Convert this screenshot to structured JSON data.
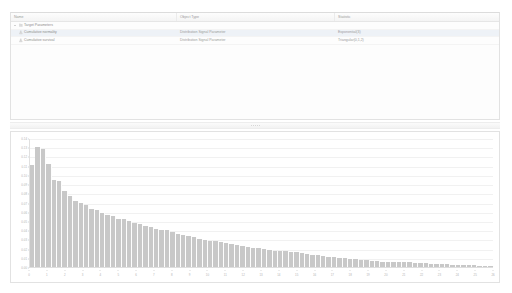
{
  "tree": {
    "columns": [
      {
        "key": "name",
        "label": "Name"
      },
      {
        "key": "type",
        "label": "Object Type"
      },
      {
        "key": "value",
        "label": "Statistic"
      }
    ],
    "rows": [
      {
        "level": 0,
        "expanded": true,
        "icon": "folder-node-icon",
        "name": "Target Parameters",
        "type": "",
        "value": "",
        "selected": false
      },
      {
        "level": 1,
        "icon": "signal-leaf-icon",
        "name": "Cumulative normality",
        "type": "Distribution Signal Parameter",
        "value": "Exponential(3)",
        "selected": true
      },
      {
        "level": 1,
        "icon": "signal-leaf-icon",
        "name": "Cumulative survival",
        "type": "Distribution Signal Parameter",
        "value": "Triangular(0,1,2)",
        "selected": false
      }
    ]
  },
  "splitter": {
    "name": "horizontal-splitter",
    "grip_dots": 5
  },
  "chart_data": {
    "type": "bar",
    "title": "",
    "subtitle": "",
    "xlabel": "",
    "ylabel": "",
    "grid": true,
    "legend": false,
    "xlim": [
      0,
      26
    ],
    "ylim": [
      0,
      0.14
    ],
    "ytick_labels": [
      "0.00",
      "0.01",
      "0.02",
      "0.03",
      "0.04",
      "0.05",
      "0.06",
      "0.07",
      "0.08",
      "0.09",
      "0.10",
      "0.11",
      "0.12",
      "0.13",
      "0.14"
    ],
    "ytick_values": [
      0,
      0.01,
      0.02,
      0.03,
      0.04,
      0.05,
      0.06,
      0.07,
      0.08,
      0.09,
      0.1,
      0.11,
      0.12,
      0.13,
      0.14
    ],
    "xtick_labels": [
      "0",
      "1",
      "2",
      "3",
      "4",
      "5",
      "6",
      "7",
      "8",
      "9",
      "10",
      "11",
      "12",
      "13",
      "14",
      "15",
      "16",
      "17",
      "18",
      "19",
      "20",
      "21",
      "22",
      "23",
      "24",
      "25",
      "26"
    ],
    "xtick_values": [
      0,
      1,
      2,
      3,
      4,
      5,
      6,
      7,
      8,
      9,
      10,
      11,
      12,
      13,
      14,
      15,
      16,
      17,
      18,
      19,
      20,
      21,
      22,
      23,
      24,
      25,
      26
    ],
    "bar_color": "#c8c8c8",
    "categories": [
      "0.0",
      "0.2",
      "0.4",
      "0.6",
      "0.8",
      "1.0",
      "1.2",
      "1.4",
      "1.6",
      "1.8",
      "2.0",
      "2.2",
      "2.4",
      "2.6",
      "2.8",
      "3.0",
      "3.2",
      "3.4",
      "3.6",
      "3.8",
      "4.0",
      "4.2",
      "4.4",
      "4.6",
      "4.8",
      "5.0",
      "5.2",
      "5.4",
      "5.6",
      "5.8",
      "6.0",
      "6.2",
      "6.4",
      "6.6",
      "6.8",
      "7.0",
      "7.2",
      "7.4",
      "7.6",
      "7.8",
      "8.0",
      "8.2",
      "8.4",
      "8.6",
      "8.8",
      "9.0",
      "9.2",
      "9.4",
      "9.6",
      "9.8",
      "10.0",
      "10.4",
      "10.8",
      "11.2",
      "11.6",
      "12.0",
      "12.4",
      "12.8",
      "13.2",
      "13.6",
      "14.0",
      "14.4",
      "14.8",
      "15.2",
      "15.6",
      "16.0",
      "16.4",
      "16.8",
      "17.2",
      "17.6",
      "18.0",
      "18.5",
      "19.0",
      "19.5",
      "20.0",
      "20.5",
      "21.0",
      "21.5",
      "22.0",
      "22.5",
      "23.0",
      "23.5",
      "24.0",
      "24.5",
      "25.0",
      "25.5"
    ],
    "values": [
      0.112,
      0.131,
      0.129,
      0.113,
      0.095,
      0.094,
      0.083,
      0.078,
      0.072,
      0.07,
      0.068,
      0.063,
      0.062,
      0.059,
      0.057,
      0.056,
      0.053,
      0.052,
      0.05,
      0.048,
      0.047,
      0.045,
      0.044,
      0.042,
      0.041,
      0.04,
      0.038,
      0.036,
      0.035,
      0.034,
      0.033,
      0.031,
      0.03,
      0.029,
      0.028,
      0.027,
      0.026,
      0.025,
      0.024,
      0.023,
      0.022,
      0.021,
      0.021,
      0.02,
      0.019,
      0.018,
      0.018,
      0.017,
      0.016,
      0.016,
      0.015,
      0.014,
      0.013,
      0.013,
      0.012,
      0.011,
      0.011,
      0.01,
      0.01,
      0.009,
      0.009,
      0.008,
      0.008,
      0.007,
      0.007,
      0.006,
      0.006,
      0.006,
      0.005,
      0.005,
      0.005,
      0.004,
      0.004,
      0.004,
      0.003,
      0.003,
      0.003,
      0.003,
      0.002,
      0.002,
      0.002,
      0.002,
      0.002,
      0.001,
      0.001,
      0.001
    ]
  }
}
